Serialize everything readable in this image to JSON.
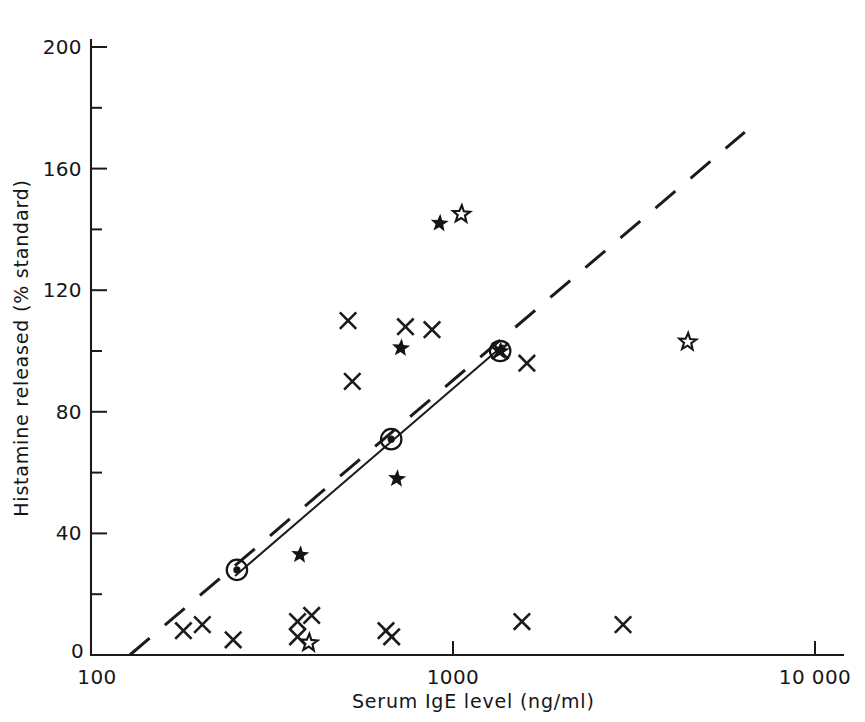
{
  "chart_data": {
    "type": "scatter",
    "title": "",
    "xlabel": "Serum IgE level (ng/ml)",
    "ylabel": "Histamine released (% standard)",
    "xscale": "log",
    "yscale": "linear",
    "xlim": [
      100,
      10000
    ],
    "ylim": [
      0,
      200
    ],
    "grid": false,
    "legend_position": "none",
    "x_ticks": [
      {
        "value": 100,
        "label": "100"
      },
      {
        "value": 1000,
        "label": "1000"
      },
      {
        "value": 10000,
        "label": "10 000"
      }
    ],
    "y_ticks": [
      {
        "value": 0,
        "label": "0",
        "minor": false
      },
      {
        "value": 20,
        "label": "",
        "minor": true
      },
      {
        "value": 40,
        "label": "40",
        "minor": false
      },
      {
        "value": 60,
        "label": "",
        "minor": true
      },
      {
        "value": 80,
        "label": "80",
        "minor": false
      },
      {
        "value": 100,
        "label": "",
        "minor": true
      },
      {
        "value": 120,
        "label": "120",
        "minor": false
      },
      {
        "value": 140,
        "label": "",
        "minor": true
      },
      {
        "value": 160,
        "label": "160",
        "minor": false
      },
      {
        "value": 180,
        "label": "",
        "minor": true
      },
      {
        "value": 200,
        "label": "200",
        "minor": false
      }
    ],
    "series": [
      {
        "name": "cross",
        "marker": "x",
        "points": [
          [
            180,
            8
          ],
          [
            203,
            10
          ],
          [
            247,
            5
          ],
          [
            372,
            11
          ],
          [
            372,
            6
          ],
          [
            407,
            13
          ],
          [
            513,
            110
          ],
          [
            527,
            90
          ],
          [
            653,
            8
          ],
          [
            677,
            6
          ],
          [
            739,
            108
          ],
          [
            875,
            107
          ],
          [
            1350,
            100
          ],
          [
            1600,
            96
          ],
          [
            1550,
            11
          ],
          [
            2950,
            10
          ]
        ]
      },
      {
        "name": "filled-star",
        "marker": "star-filled",
        "points": [
          [
            378,
            33
          ],
          [
            700,
            58
          ],
          [
            718,
            101
          ],
          [
            918,
            142
          ],
          [
            1350,
            100
          ]
        ]
      },
      {
        "name": "open-star",
        "marker": "star-open",
        "points": [
          [
            400,
            4
          ],
          [
            1055,
            145
          ],
          [
            4450,
            103
          ]
        ]
      },
      {
        "name": "circled-mean",
        "marker": "circled-dot",
        "points": [
          [
            253,
            28
          ],
          [
            675,
            71
          ],
          [
            1350,
            100
          ]
        ]
      }
    ],
    "lines": [
      {
        "name": "regression-fit",
        "style": "solid",
        "from": [
          250,
          26
        ],
        "to": [
          1380,
          102
        ]
      },
      {
        "name": "reference-trend",
        "style": "dashed",
        "from": [
          128,
          0
        ],
        "to": [
          6400,
          172
        ]
      }
    ]
  }
}
